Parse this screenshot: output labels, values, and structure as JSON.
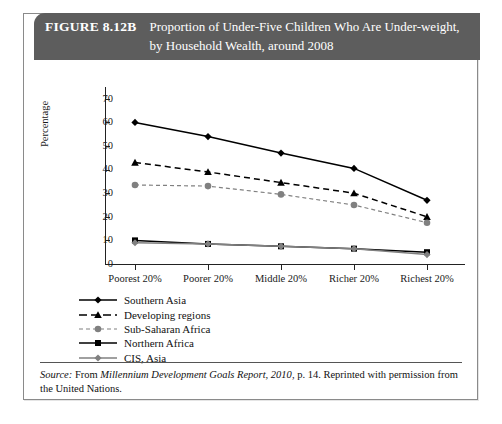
{
  "figure": {
    "number": "FIGURE 8.12B",
    "caption": "Proportion of Under-Five Children Who Are Under-weight, by Household Wealth, around 2008",
    "header_color": "#5d5d5d"
  },
  "source": {
    "lead": "Source:",
    "text_before_title": " From ",
    "title": "Millennium Development Goals Report, 2010",
    "text_after_title": ", p. 14. Reprinted with permission from the United Nations."
  },
  "chart_data": {
    "type": "line",
    "xlabel": "",
    "ylabel": "Percentage",
    "ylim": [
      0,
      75
    ],
    "yticks": [
      0,
      10,
      20,
      30,
      40,
      50,
      60,
      70
    ],
    "grid": false,
    "legend_position": "below-left",
    "categories": [
      "Poorest 20%",
      "Poorer 20%",
      "Middle 20%",
      "Richer 20%",
      "Richest 20%"
    ],
    "series": [
      {
        "name": "Southern Asia",
        "values": [
          60,
          54,
          47,
          40.5,
          27
        ],
        "color": "#000000",
        "line_style": "solid",
        "marker": "diamond"
      },
      {
        "name": "Developing regions",
        "values": [
          43,
          39,
          34.5,
          30,
          20
        ],
        "color": "#000000",
        "line_style": "dashed",
        "marker": "triangle"
      },
      {
        "name": "Sub-Saharan Africa",
        "values": [
          33.5,
          33,
          29.5,
          25,
          17.5
        ],
        "color": "#808080",
        "line_style": "dashed",
        "marker": "circle"
      },
      {
        "name": "Northern Africa",
        "values": [
          10,
          8.5,
          7.5,
          6.5,
          5
        ],
        "color": "#000000",
        "line_style": "solid",
        "marker": "square"
      },
      {
        "name": "CIS, Asia",
        "values": [
          9,
          8.5,
          7.5,
          6.5,
          4
        ],
        "color": "#808080",
        "line_style": "solid",
        "marker": "diamond"
      }
    ]
  }
}
